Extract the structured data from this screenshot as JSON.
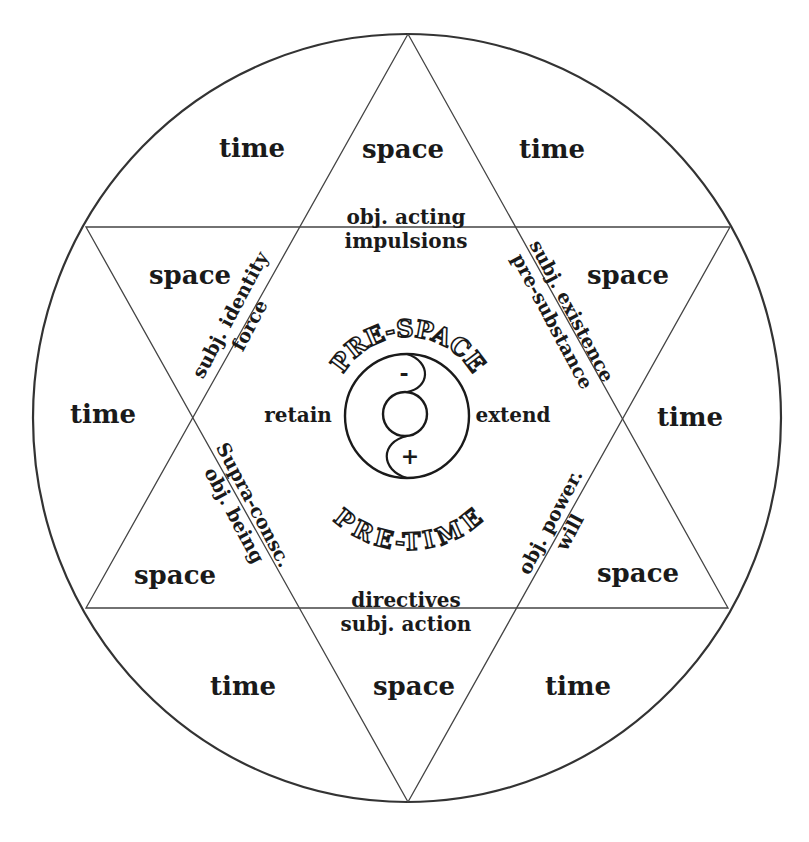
{
  "diagram": {
    "type": "hexagram-in-circle",
    "outer_regions": {
      "top_left": "time",
      "top": "space",
      "top_right": "time",
      "upper_left": "space",
      "upper_right": "space",
      "left": "time",
      "right": "time",
      "lower_left": "space",
      "lower_right": "space",
      "bottom_left": "time",
      "bottom": "space",
      "bottom_right": "time"
    },
    "inner_labels": {
      "top_line1": "obj. acting",
      "top_line2": "impulsions",
      "upper_left_line1": "subj. identity",
      "upper_left_line2": "force",
      "upper_right_line1": "subj. existence",
      "upper_right_line2": "pre-substance",
      "lower_left_line1": "Supra-consc.",
      "lower_left_line2": "obj. being",
      "lower_right_line1": "obj. power.",
      "lower_right_line2": "will",
      "bottom_line1": "directives",
      "bottom_line2": "subj. action",
      "left": "retain",
      "right": "extend"
    },
    "center": {
      "arc_top": "PRE-SPACE",
      "arc_bottom": "PRE-TIME",
      "minus": "-",
      "plus": "+"
    },
    "colors": {
      "line": "#333333",
      "text": "#1a1a1a",
      "background": "#ffffff"
    }
  }
}
